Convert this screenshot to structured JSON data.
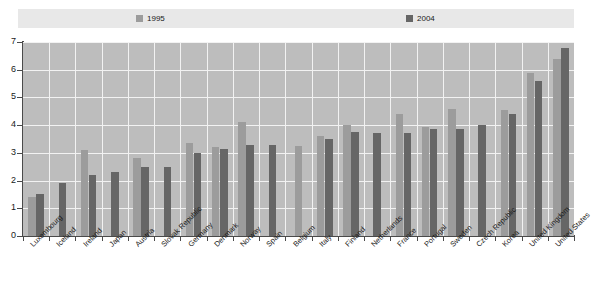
{
  "legend": {
    "items": [
      {
        "label": "1995",
        "color": "#9c9c9c"
      },
      {
        "label": "2004",
        "color": "#666666"
      }
    ]
  },
  "chart_data": {
    "type": "bar",
    "title": "",
    "subtitle": "",
    "xlabel": "",
    "ylabel": "",
    "ylim": [
      0,
      7
    ],
    "yticks": [
      "0",
      "1",
      "2",
      "3",
      "4",
      "5",
      "6",
      "7"
    ],
    "grid": true,
    "legend_position": "top",
    "categories": [
      "Luxembourg",
      "Iceland",
      "Ireland",
      "Japan",
      "Austria",
      "Slovak Republic",
      "Germany",
      "Denmark",
      "Norway",
      "Spain",
      "Belgium",
      "Italy",
      "Finland",
      "Netherlands",
      "France",
      "Portugal",
      "Sweden",
      "Czech Republic",
      "Korea",
      "United Kingdom",
      "United States"
    ],
    "series": [
      {
        "name": "1995",
        "color": "#9c9c9c",
        "values": [
          1.4,
          null,
          3.1,
          null,
          2.8,
          null,
          3.35,
          3.2,
          4.1,
          null,
          3.25,
          3.6,
          4.0,
          null,
          4.4,
          3.95,
          4.6,
          null,
          4.55,
          5.9,
          6.4
        ]
      },
      {
        "name": "2004",
        "color": "#666666",
        "values": [
          1.5,
          1.9,
          2.2,
          2.3,
          2.5,
          2.5,
          3.0,
          3.15,
          3.3,
          3.3,
          null,
          3.5,
          3.75,
          3.7,
          3.7,
          3.85,
          3.85,
          4.0,
          4.4,
          5.6,
          6.8
        ]
      }
    ]
  }
}
